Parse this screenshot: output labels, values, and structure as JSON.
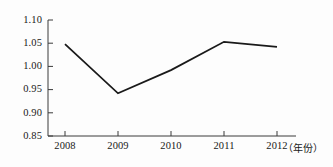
{
  "chart_data": {
    "type": "line",
    "title": "",
    "subtitle": "",
    "xlabel": "（年份）",
    "ylabel": "",
    "categories": [
      "2008",
      "2009",
      "2010",
      "2011",
      "2012"
    ],
    "x": [
      2008,
      2009,
      2010,
      2011,
      2012
    ],
    "values": [
      1.048,
      0.942,
      0.992,
      1.053,
      1.042
    ],
    "series": [
      {
        "name": "",
        "values": [
          1.048,
          0.942,
          0.992,
          1.053,
          1.042
        ]
      }
    ],
    "ylim": [
      0.85,
      1.1
    ],
    "xlim": [
      2008,
      2012
    ],
    "ytick_labels": [
      "1.10",
      "1.05",
      "1.00",
      "0.95",
      "0.90",
      "0.85"
    ],
    "ytick_values": [
      1.1,
      1.05,
      1.0,
      0.95,
      0.9,
      0.85
    ],
    "xtick_labels": [
      "2008",
      "2009",
      "2010",
      "2011",
      "2012"
    ],
    "grid": false,
    "legend": "none",
    "markers": false,
    "line_color": "#1a1a1a",
    "axis_color": "#3a3a3a",
    "background_color": "#fdfdfd"
  },
  "axis": {
    "x_note": "（年份）"
  }
}
